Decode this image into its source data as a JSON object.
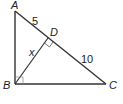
{
  "diagram": {
    "type": "right-triangle-with-altitude",
    "vertices": {
      "A": {
        "label": "A",
        "x": 15,
        "y": 11
      },
      "B": {
        "label": "B",
        "x": 15,
        "y": 84
      },
      "C": {
        "label": "C",
        "x": 106,
        "y": 84
      },
      "D": {
        "label": "D",
        "x": 48,
        "y": 38
      }
    },
    "segments": {
      "AD": {
        "label": "5"
      },
      "DC": {
        "label": "10"
      },
      "BD": {
        "label": "x"
      }
    },
    "right_angles": [
      "B",
      "D"
    ],
    "stroke_color": "#333333"
  }
}
